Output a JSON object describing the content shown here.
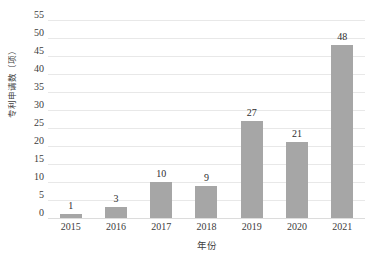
{
  "chart_data": {
    "type": "bar",
    "title": "",
    "xlabel": "年份",
    "ylabel": "专利申请数（项）",
    "categories": [
      "2015",
      "2016",
      "2017",
      "2018",
      "2019",
      "2020",
      "2021"
    ],
    "values": [
      1,
      3,
      10,
      9,
      27,
      21,
      48
    ],
    "value_labels": [
      "1",
      "3",
      "10",
      "9",
      "27",
      "21",
      "48"
    ],
    "ylim": [
      0,
      55
    ],
    "ytick_step": 5,
    "ytick_labels": [
      "0",
      "5",
      "10",
      "15",
      "20",
      "25",
      "30",
      "35",
      "40",
      "45",
      "50",
      "55"
    ],
    "grid": "horizontal",
    "legend": "none",
    "series": [
      {
        "name": "专利申请数",
        "values": [
          1,
          3,
          10,
          9,
          27,
          21,
          48
        ]
      }
    ]
  },
  "style": {
    "bar_color": "#a6a6a6",
    "gridline_color": "#e8e8e8",
    "text_color": "#3c3c3c",
    "background": "#ffffff"
  }
}
